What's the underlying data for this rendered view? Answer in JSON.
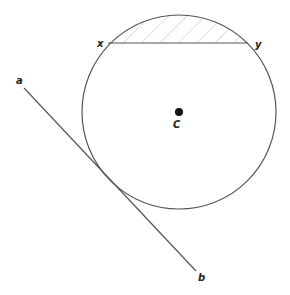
{
  "diagram": {
    "type": "geometry",
    "colors": {
      "stroke": "#555555",
      "hatch": "#bbbbbb",
      "center_dot": "#111111",
      "label": "#222222",
      "background": "#ffffff"
    },
    "circle": {
      "cx": 179,
      "cy": 112,
      "r": 97
    },
    "center": {
      "label": "C",
      "x": 179,
      "y": 112
    },
    "chord": {
      "y": 43,
      "endpoints": [
        {
          "label": "x",
          "x": 108,
          "y": 43
        },
        {
          "label": "y",
          "x": 248,
          "y": 43
        }
      ],
      "shaded_segment": "minor segment above chord, diagonal hatching"
    },
    "tangent": {
      "endpoints": [
        {
          "label": "a",
          "x": 24,
          "y": 88
        },
        {
          "label": "b",
          "x": 196,
          "y": 271
        }
      ]
    },
    "labels": {
      "a": "a",
      "b": "b",
      "x": "x",
      "y": "y",
      "C": "C"
    }
  }
}
